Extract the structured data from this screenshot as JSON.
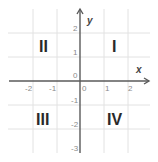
{
  "diagram": {
    "axes": {
      "x_label": "x",
      "y_label": "y",
      "x_ticks": [
        "-2",
        "-1",
        "0",
        "1",
        "2"
      ],
      "y_ticks": [
        "2",
        "1",
        "0",
        "-1",
        "-2",
        "-3"
      ]
    },
    "quadrants": {
      "q1": "I",
      "q2": "II",
      "q3": "III",
      "q4": "IV"
    },
    "colors": {
      "axis": "#5a5a5a",
      "grid": "#e2e2e2",
      "tick_text": "#8a8a8a",
      "quadrant_text": "#2a2a2a"
    }
  }
}
